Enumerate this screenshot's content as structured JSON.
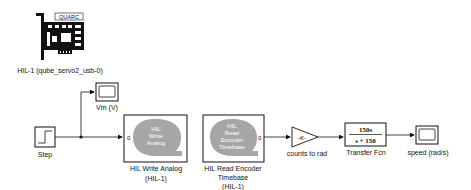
{
  "diagram": {
    "type": "simulink-model",
    "blocks": {
      "hil_initialize": {
        "label": "HIL-1 (qube_servo2_usb-0)",
        "brand": "QUARC"
      },
      "vm_scope": {
        "label": "Vm (V)"
      },
      "step": {
        "label": "Step"
      },
      "hil_write_analog": {
        "icon_lines": [
          "HIL",
          "Write",
          "Analog"
        ],
        "port": "0",
        "label_line1": "HIL Write Analog",
        "label_line2": "(HIL-1)"
      },
      "hil_read_encoder": {
        "icon_lines": [
          "HIL",
          "Read",
          "Encoder",
          "Timebase"
        ],
        "port": "0",
        "label_line1": "HIL Read Encoder",
        "label_line2": "Timebase",
        "label_line3": "(HIL-1)"
      },
      "gain": {
        "value": "-K-",
        "label": "counts to rad"
      },
      "transfer_fcn": {
        "numerator": "150s",
        "denominator": "s + 150",
        "label": "Transfer Fcn"
      },
      "speed_scope": {
        "label": "speed (rad/s)"
      }
    },
    "colors": {
      "line": "#111111",
      "block_border": "#111111",
      "q_logo": "#a6a6a6",
      "block_fill": "#ffffff"
    }
  }
}
